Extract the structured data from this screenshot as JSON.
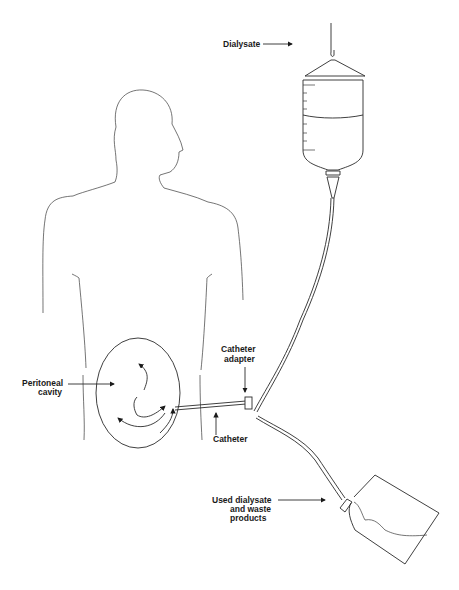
{
  "diagram": {
    "labels": {
      "dialysate": "Dialysate",
      "catheter_adapter_1": "Catheter",
      "catheter_adapter_2": "adapter",
      "peritoneal_cavity_1": "Peritoneal",
      "peritoneal_cavity_2": "cavity",
      "catheter": "Catheter",
      "used_1": "Used dialysate",
      "used_2": "and waste",
      "used_3": "products"
    },
    "components": [
      "human-figure",
      "peritoneal-cavity",
      "dialysate-bag",
      "tubing",
      "catheter-adapter",
      "catheter",
      "drain-bag"
    ]
  }
}
